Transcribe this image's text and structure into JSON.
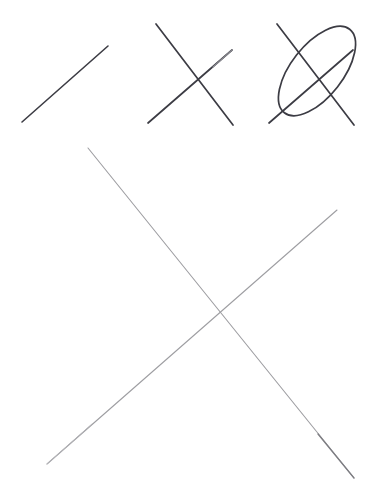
{
  "page": {
    "background_color": "#ffffff",
    "width": 491,
    "height": 491
  },
  "palette": {
    "dark_stroke": "#3c3c44",
    "dark_stroke_soft": "#4a4a52",
    "light_stroke": "#9e9ea2",
    "light_stroke_soft": "#b4b4b8",
    "light_stroke_strong": "#7d7d82"
  },
  "figures": [
    {
      "id": "figure-1",
      "name": "single-diagonal-line",
      "label": "single stroke",
      "stroke_color": "#3c3c44",
      "stroke_width": 1.6,
      "strokes": [
        {
          "name": "diagonal-stroke",
          "kind": "line",
          "points": [
            [
              22,
              122
            ],
            [
              108,
              46
            ]
          ]
        }
      ]
    },
    {
      "id": "figure-2",
      "name": "cross-x-mark",
      "label": "two crossing strokes",
      "stroke_color": "#3c3c44",
      "stroke_width": 1.7,
      "strokes": [
        {
          "name": "descending-stroke",
          "kind": "line",
          "points": [
            [
              156,
              24
            ],
            [
              233,
              125
            ]
          ]
        },
        {
          "name": "ascending-stroke",
          "kind": "line",
          "points": [
            [
              148,
              123
            ],
            [
              232,
              50
            ]
          ]
        }
      ]
    },
    {
      "id": "figure-3",
      "name": "cross-with-ellipse",
      "label": "crossing strokes enclosed by ellipse",
      "stroke_color": "#3c3c44",
      "stroke_width": 1.7,
      "strokes": [
        {
          "name": "descending-stroke",
          "kind": "line",
          "points": [
            [
              277,
              24
            ],
            [
              354,
              125
            ]
          ]
        },
        {
          "name": "ascending-stroke",
          "kind": "line",
          "points": [
            [
              269,
              123
            ],
            [
              353,
              50
            ]
          ]
        },
        {
          "name": "ellipse-stroke",
          "kind": "ellipse",
          "center": [
            317,
            71
          ],
          "radius_x": 26,
          "radius_y": 53,
          "rotation_deg": 38
        }
      ]
    },
    {
      "id": "figure-4",
      "name": "large-cross-x-mark",
      "label": "large faint crossing strokes",
      "stroke_color": "#9e9ea2",
      "stroke_width": 1.1,
      "strokes": [
        {
          "name": "descending-stroke",
          "kind": "line",
          "points": [
            [
              88,
              148
            ],
            [
              354,
              478
            ]
          ]
        },
        {
          "name": "ascending-stroke",
          "kind": "line",
          "points": [
            [
              47,
              464
            ],
            [
              337,
              210
            ]
          ]
        }
      ],
      "intersection": [
        215,
        316
      ]
    }
  ]
}
